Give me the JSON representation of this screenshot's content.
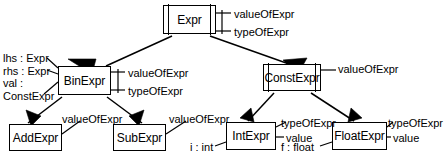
{
  "diagram": {
    "type": "uml-class-inheritance",
    "stroke_color": "#000000",
    "background_color": "#ffffff",
    "nodes": [
      {
        "id": "expr",
        "label": "Expr",
        "abstract": true,
        "x": 163,
        "y": 5,
        "w": 53,
        "h": 29
      },
      {
        "id": "binexpr",
        "label": "BinExpr",
        "abstract": false,
        "x": 58,
        "y": 66,
        "w": 53,
        "h": 29
      },
      {
        "id": "constexpr",
        "label": "ConstExpr",
        "abstract": true,
        "x": 263,
        "y": 64,
        "w": 58,
        "h": 27
      },
      {
        "id": "addexpr",
        "label": "AddExpr",
        "abstract": false,
        "x": 9,
        "y": 124,
        "w": 53,
        "h": 27
      },
      {
        "id": "subexpr",
        "label": "SubExpr",
        "abstract": false,
        "x": 113,
        "y": 124,
        "w": 53,
        "h": 27
      },
      {
        "id": "intexpr",
        "label": "IntExpr",
        "abstract": false,
        "x": 226,
        "y": 122,
        "w": 50,
        "h": 28
      },
      {
        "id": "floatexpr",
        "label": "FloatExpr",
        "abstract": false,
        "x": 332,
        "y": 122,
        "w": 55,
        "h": 28
      }
    ],
    "annotations": [
      {
        "id": "expr-value",
        "text": "valueOfExpr",
        "x": 234,
        "y": 8,
        "align": "left"
      },
      {
        "id": "expr-type",
        "text": "typeOfExpr",
        "x": 234,
        "y": 26,
        "align": "left"
      },
      {
        "id": "binexpr-attrs",
        "text": "lhs : Expr\nrhs : Expr\nval :\nConstExpr",
        "x": 3,
        "y": 52,
        "align": "left"
      },
      {
        "id": "binexpr-value",
        "text": "valueOfExpr",
        "x": 128,
        "y": 67,
        "align": "left"
      },
      {
        "id": "binexpr-type",
        "text": "typeOfExpr",
        "x": 128,
        "y": 85,
        "align": "left"
      },
      {
        "id": "constexpr-value",
        "text": "valueOfExpr",
        "x": 338,
        "y": 63,
        "align": "left"
      },
      {
        "id": "addexpr-value",
        "text": "valueOfExpr",
        "x": 62,
        "y": 113,
        "align": "left"
      },
      {
        "id": "subexpr-value",
        "text": "valueOfExpr",
        "x": 169,
        "y": 113,
        "align": "left"
      },
      {
        "id": "intexpr-type",
        "text": "typeOfExpr",
        "x": 281,
        "y": 117,
        "align": "left"
      },
      {
        "id": "intexpr-value",
        "text": "value",
        "x": 286,
        "y": 132,
        "align": "left"
      },
      {
        "id": "intexpr-field",
        "text": "i : int",
        "x": 190,
        "y": 141,
        "align": "left"
      },
      {
        "id": "floatexpr-type",
        "text": "typeOfExpr",
        "x": 388,
        "y": 117,
        "align": "left"
      },
      {
        "id": "floatexpr-value",
        "text": "value",
        "x": 393,
        "y": 132,
        "align": "left"
      },
      {
        "id": "floatexpr-field",
        "text": "f : float",
        "x": 281,
        "y": 141,
        "align": "left"
      }
    ],
    "inheritance_edges": [
      {
        "id": "binexpr-to-expr",
        "from": "binexpr",
        "to": "expr"
      },
      {
        "id": "constexpr-to-expr",
        "from": "constexpr",
        "to": "expr"
      },
      {
        "id": "addexpr-to-binexpr",
        "from": "addexpr",
        "to": "binexpr"
      },
      {
        "id": "subexpr-to-binexpr",
        "from": "subexpr",
        "to": "binexpr"
      },
      {
        "id": "intexpr-to-constexpr",
        "from": "intexpr",
        "to": "constexpr"
      },
      {
        "id": "floatexpr-to-constexpr",
        "from": "floatexpr",
        "to": "constexpr"
      }
    ]
  }
}
